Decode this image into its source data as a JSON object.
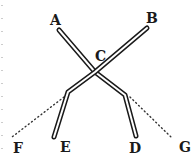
{
  "figure": {
    "background": "#ffffff",
    "ink": "#1a1a1a",
    "labels": [
      {
        "id": "A",
        "text": "A",
        "x": 50,
        "y": 25
      },
      {
        "id": "B",
        "text": "B",
        "x": 146,
        "y": 23
      },
      {
        "id": "C",
        "text": "C",
        "x": 95,
        "y": 61
      },
      {
        "id": "D",
        "text": "D",
        "x": 129,
        "y": 153
      },
      {
        "id": "E",
        "text": "E",
        "x": 60,
        "y": 152
      },
      {
        "id": "F",
        "text": "F",
        "x": 13,
        "y": 153
      },
      {
        "id": "G",
        "text": "G",
        "x": 179,
        "y": 152
      }
    ],
    "rods": [
      {
        "name": "rod-A-C-D",
        "points": "59,30 95,72 125,95 136,136"
      },
      {
        "name": "rod-B-C-E",
        "points": "147,28 95,72 68,92 54,137"
      }
    ],
    "dotted_lines": [
      {
        "name": "dotted-line-to-F",
        "x1": 64,
        "y1": 97,
        "x2": 12,
        "y2": 137
      },
      {
        "name": "dotted-line-to-G",
        "x1": 130,
        "y1": 97,
        "x2": 172,
        "y2": 138
      }
    ]
  }
}
